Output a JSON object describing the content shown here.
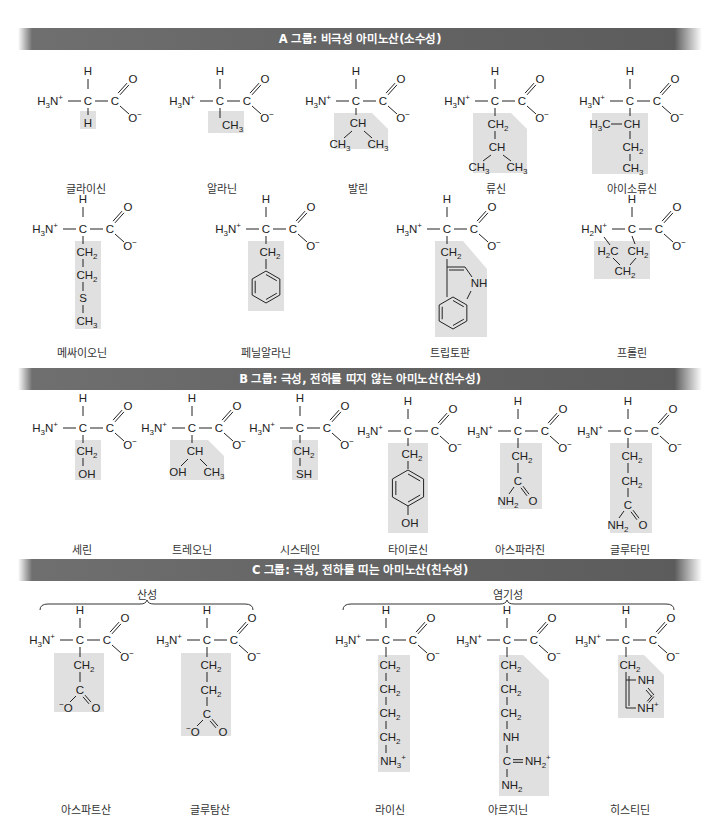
{
  "groups": {
    "a": {
      "title": "A 그룹: 비극성 아미노산(소수성)"
    },
    "b": {
      "title": "B 그룹: 극성, 전하를 띠지 않는 아미노산(친수성)"
    },
    "c": {
      "title": "C 그룹: 극성, 전하를 띠는 아미노산(친수성)",
      "acidic_label": "산성",
      "basic_label": "염기성"
    }
  },
  "backbone": {
    "h": "H",
    "amine": "H3N+",
    "alpha_c": "C",
    "carboxyl_c": "C",
    "o_double": "O",
    "o_minus": "O−"
  },
  "amino_acids": {
    "glycine": "글라이신",
    "alanine": "알라닌",
    "valine": "발린",
    "leucine": "류신",
    "isoleucine": "아이소류신",
    "methionine": "메싸이오닌",
    "phenylalanine": "페닐알라닌",
    "tryptophan": "트립토판",
    "proline": "프롤린",
    "serine": "세린",
    "threonine": "트레오닌",
    "cysteine": "시스테인",
    "tyrosine": "타이로신",
    "asparagine": "아스파라진",
    "glutamine": "글루타민",
    "aspartate": "아스파트산",
    "glutamate": "글루탐산",
    "lysine": "라이신",
    "arginine": "아르지닌",
    "histidine": "히스티딘"
  },
  "side_chains": {
    "glycine": [
      "H"
    ],
    "alanine": [
      "CH3"
    ],
    "valine": [
      "CH",
      "CH3",
      "CH3"
    ],
    "leucine": [
      "CH2",
      "CH",
      "CH3",
      "CH3"
    ],
    "isoleucine": [
      "H3C",
      "CH",
      "CH2",
      "CH3"
    ],
    "methionine": [
      "CH2",
      "CH2",
      "S",
      "CH3"
    ],
    "phenylalanine": [
      "CH2",
      "benzene-ring"
    ],
    "tryptophan": [
      "CH2",
      "NH",
      "indole-ring"
    ],
    "proline": [
      "H2N+",
      "H2C",
      "CH2",
      "CH2"
    ],
    "serine": [
      "CH2",
      "OH"
    ],
    "threonine": [
      "CH",
      "OH",
      "CH3"
    ],
    "cysteine": [
      "CH2",
      "SH"
    ],
    "tyrosine": [
      "CH2",
      "phenol-ring",
      "OH"
    ],
    "asparagine": [
      "CH2",
      "C",
      "NH2",
      "O"
    ],
    "glutamine": [
      "CH2",
      "CH2",
      "C",
      "NH2",
      "O"
    ],
    "aspartate": [
      "CH2",
      "C",
      "−O",
      "O"
    ],
    "glutamate": [
      "CH2",
      "CH2",
      "C",
      "−O",
      "O"
    ],
    "lysine": [
      "CH2",
      "CH2",
      "CH2",
      "CH2",
      "NH3+"
    ],
    "arginine": [
      "CH2",
      "CH2",
      "CH2",
      "NH",
      "C",
      "NH2+",
      "NH2"
    ],
    "histidine": [
      "CH2",
      "NH",
      "NH+",
      "imidazole-ring"
    ]
  },
  "colors": {
    "bar": "#646464",
    "bar_text": "#ffffff",
    "highlight": "#e0e0e0",
    "text": "#222222"
  }
}
